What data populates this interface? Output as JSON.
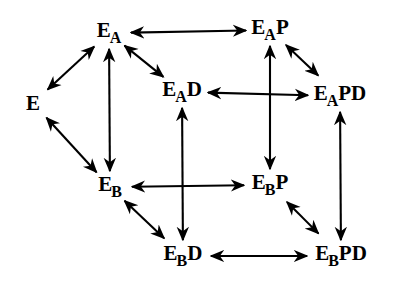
{
  "diagram": {
    "type": "lattice-commutative-diagram",
    "title": "",
    "arrow_style": "double-headed",
    "stroke_color": "#000000",
    "background_color": "#ffffff",
    "nodes": [
      {
        "id": "E",
        "base": "E",
        "sub": "",
        "suffix": "",
        "full": "E",
        "x": 33,
        "y": 103
      },
      {
        "id": "EA",
        "base": "E",
        "sub": "A",
        "suffix": "",
        "full": "EA",
        "x": 109,
        "y": 33
      },
      {
        "id": "EAP",
        "base": "E",
        "sub": "A",
        "suffix": "P",
        "full": "EAP",
        "x": 270,
        "y": 30
      },
      {
        "id": "EAD",
        "base": "E",
        "sub": "A",
        "suffix": "D",
        "full": "EAD",
        "x": 182,
        "y": 92
      },
      {
        "id": "EAPD",
        "base": "E",
        "sub": "A",
        "suffix": "PD",
        "full": "EAPD",
        "x": 340,
        "y": 96
      },
      {
        "id": "EB",
        "base": "E",
        "sub": "B",
        "suffix": "",
        "full": "EB",
        "x": 110,
        "y": 187
      },
      {
        "id": "EBP",
        "base": "E",
        "sub": "B",
        "suffix": "P",
        "full": "EBP",
        "x": 270,
        "y": 185
      },
      {
        "id": "EBD",
        "base": "E",
        "sub": "B",
        "suffix": "D",
        "full": "EBD",
        "x": 183,
        "y": 256
      },
      {
        "id": "EBPD",
        "base": "E",
        "sub": "B",
        "suffix": "PD",
        "full": "EBPD",
        "x": 341,
        "y": 256
      }
    ],
    "edges": [
      {
        "id": "E-EA",
        "from": "E",
        "to": "EA",
        "orientation": "diagonal-up-right"
      },
      {
        "id": "E-EB",
        "from": "E",
        "to": "EB",
        "orientation": "diagonal-down-right"
      },
      {
        "id": "EA-EAP",
        "from": "EA",
        "to": "EAP",
        "orientation": "horizontal"
      },
      {
        "id": "EA-EAD",
        "from": "EA",
        "to": "EAD",
        "orientation": "diagonal-down-right"
      },
      {
        "id": "EA-EB",
        "from": "EA",
        "to": "EB",
        "orientation": "vertical"
      },
      {
        "id": "EAP-EAPD",
        "from": "EAP",
        "to": "EAPD",
        "orientation": "diagonal-down-right"
      },
      {
        "id": "EAP-EBP",
        "from": "EAP",
        "to": "EBP",
        "orientation": "vertical"
      },
      {
        "id": "EAD-EAPD",
        "from": "EAD",
        "to": "EAPD",
        "orientation": "horizontal"
      },
      {
        "id": "EAD-EBD",
        "from": "EAD",
        "to": "EBD",
        "orientation": "vertical"
      },
      {
        "id": "EAPD-EBPD",
        "from": "EAPD",
        "to": "EBPD",
        "orientation": "vertical"
      },
      {
        "id": "EB-EBP",
        "from": "EB",
        "to": "EBP",
        "orientation": "horizontal"
      },
      {
        "id": "EB-EBD",
        "from": "EB",
        "to": "EBD",
        "orientation": "diagonal-down-right"
      },
      {
        "id": "EBP-EBPD",
        "from": "EBP",
        "to": "EBPD",
        "orientation": "diagonal-down-right"
      },
      {
        "id": "EBD-EBPD",
        "from": "EBD",
        "to": "EBPD",
        "orientation": "horizontal"
      }
    ]
  }
}
